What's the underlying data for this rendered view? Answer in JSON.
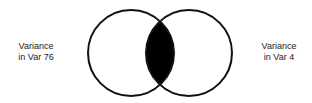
{
  "diagram": {
    "type": "venn",
    "sets": [
      {
        "id": "left",
        "label_line1": "Variance",
        "label_line2": "in Var 76"
      },
      {
        "id": "right",
        "label_line1": "Variance",
        "label_line2": "in Var 4"
      }
    ],
    "overlap": {
      "fill": "#000000",
      "description": "shared variance"
    },
    "colors": {
      "stroke": "#111111",
      "background": "#ffffff",
      "text": "#222222"
    }
  }
}
